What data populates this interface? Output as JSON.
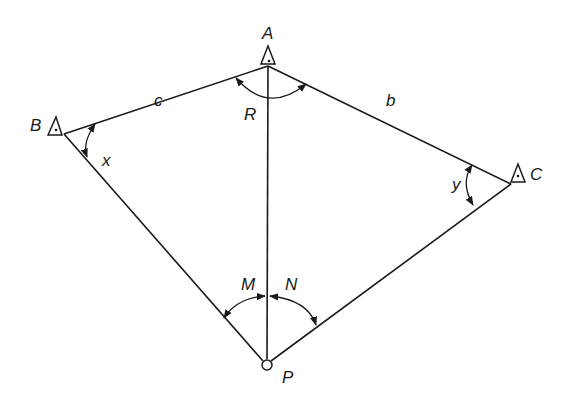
{
  "diagram": {
    "type": "surveying-resection-figure",
    "stations": [
      {
        "id": "A",
        "label": "A",
        "symbol": "triangle",
        "x": 268,
        "y": 62
      },
      {
        "id": "B",
        "label": "B",
        "symbol": "triangle",
        "x": 56,
        "y": 128
      },
      {
        "id": "C",
        "label": "C",
        "symbol": "triangle",
        "x": 518,
        "y": 178
      },
      {
        "id": "P",
        "label": "P",
        "symbol": "circle",
        "x": 267,
        "y": 365
      }
    ],
    "sides": [
      {
        "from": "A",
        "to": "B",
        "label": "c"
      },
      {
        "from": "A",
        "to": "C",
        "label": "b"
      },
      {
        "from": "A",
        "to": "P",
        "label": ""
      },
      {
        "from": "B",
        "to": "P",
        "label": ""
      },
      {
        "from": "C",
        "to": "P",
        "label": ""
      }
    ],
    "angles": [
      {
        "vertex": "A",
        "label": "R"
      },
      {
        "vertex": "B",
        "label": "x"
      },
      {
        "vertex": "C",
        "label": "y"
      },
      {
        "vertex": "P",
        "label": "M",
        "between": [
          "B",
          "A"
        ]
      },
      {
        "vertex": "P",
        "label": "N",
        "between": [
          "A",
          "C"
        ]
      }
    ],
    "labels": {
      "A": "A",
      "B": "B",
      "C": "C",
      "P": "P",
      "b": "b",
      "c": "c",
      "R": "R",
      "x": "x",
      "y": "y",
      "M": "M",
      "N": "N"
    }
  }
}
